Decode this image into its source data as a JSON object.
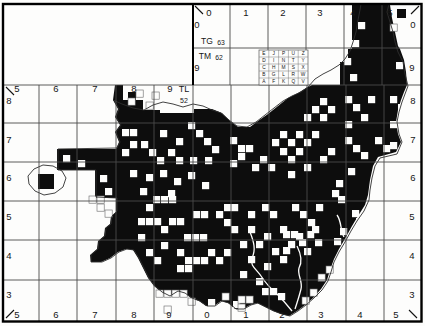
{
  "title": "Small White",
  "map": {
    "colors": {
      "ink": "#0d0d0d",
      "paper": "#fdfdfc",
      "grid": "#4a4a4a",
      "boundary": "#2e2e2e"
    },
    "tetrad_key": {
      "x": 259,
      "y": 50,
      "cell_w": 9.8,
      "cell_h": 7,
      "letters": [
        [
          "E",
          "J",
          "P",
          "U",
          "Z"
        ],
        [
          "D",
          "I",
          "N",
          "T",
          "Y"
        ],
        [
          "C",
          "H",
          "M",
          "S",
          "X"
        ],
        [
          "B",
          "G",
          "L",
          "R",
          "W"
        ],
        [
          "A",
          "F",
          "K",
          "Q",
          "V"
        ]
      ]
    },
    "grid": {
      "border": [
        3,
        4,
        418.5,
        317.5
      ],
      "main_v": [
        39,
        77,
        116,
        154,
        231,
        269,
        307,
        346,
        384
      ],
      "main_v_span": [
        85,
        321
      ],
      "main_h": [
        85,
        123,
        162,
        201,
        240,
        280
      ],
      "main_h_span": [
        3,
        421
      ],
      "divider_x": 193,
      "divider_top": 4,
      "divider_mid": 85,
      "divider_bottom": 321,
      "top_v": [
        230,
        268,
        306,
        344,
        382
      ],
      "top_v_span": [
        4,
        85
      ],
      "top_h": [
        48
      ],
      "top_h_span": [
        193,
        421
      ]
    },
    "corner_ticks": [
      [
        195,
        6,
        203,
        14
      ],
      [
        411,
        14,
        419,
        6
      ],
      [
        6,
        87,
        14,
        95
      ],
      [
        6,
        318,
        14,
        310
      ],
      [
        409,
        310,
        417,
        318
      ]
    ],
    "labels": [
      {
        "t": "0",
        "x": 209,
        "y": 16
      },
      {
        "t": "1",
        "x": 246,
        "y": 16
      },
      {
        "t": "2",
        "x": 283,
        "y": 16
      },
      {
        "t": "3",
        "x": 320,
        "y": 16
      },
      {
        "t": "4",
        "x": 353,
        "y": 16
      },
      {
        "t": "5",
        "x": 390,
        "y": 16
      },
      {
        "t": "0",
        "x": 197,
        "y": 28
      },
      {
        "t": "TG",
        "x": 207,
        "y": 44,
        "s": 8.5
      },
      {
        "t": "63",
        "x": 221,
        "y": 44.5,
        "s": 6.8
      },
      {
        "t": "TM",
        "x": 205,
        "y": 59,
        "s": 8.5
      },
      {
        "t": "62",
        "x": 219,
        "y": 59.5,
        "s": 6.8
      },
      {
        "t": "9",
        "x": 197,
        "y": 71
      },
      {
        "t": "0",
        "x": 413,
        "y": 28
      },
      {
        "t": "9",
        "x": 412,
        "y": 71
      },
      {
        "t": "5",
        "x": 17,
        "y": 92
      },
      {
        "t": "6",
        "x": 56,
        "y": 92
      },
      {
        "t": "7",
        "x": 95,
        "y": 92
      },
      {
        "t": "8",
        "x": 134,
        "y": 92
      },
      {
        "t": "9",
        "x": 170,
        "y": 92
      },
      {
        "t": "TL",
        "x": 184,
        "y": 92,
        "s": 9
      },
      {
        "t": "52",
        "x": 184,
        "y": 103,
        "s": 7
      },
      {
        "t": "8",
        "x": 9,
        "y": 104
      },
      {
        "t": "7",
        "x": 9,
        "y": 143
      },
      {
        "t": "6",
        "x": 9,
        "y": 181
      },
      {
        "t": "5",
        "x": 9,
        "y": 220
      },
      {
        "t": "4",
        "x": 9,
        "y": 259
      },
      {
        "t": "3",
        "x": 9,
        "y": 298
      },
      {
        "t": "8",
        "x": 413,
        "y": 104
      },
      {
        "t": "7",
        "x": 413,
        "y": 143
      },
      {
        "t": "6",
        "x": 413,
        "y": 181
      },
      {
        "t": "5",
        "x": 412,
        "y": 220
      },
      {
        "t": "4",
        "x": 412,
        "y": 259
      },
      {
        "t": "3",
        "x": 412,
        "y": 298
      },
      {
        "t": "5",
        "x": 17,
        "y": 318
      },
      {
        "t": "6",
        "x": 56,
        "y": 318
      },
      {
        "t": "7",
        "x": 95,
        "y": 318
      },
      {
        "t": "8",
        "x": 134,
        "y": 318
      },
      {
        "t": "9",
        "x": 169,
        "y": 318
      },
      {
        "t": "0",
        "x": 207,
        "y": 318
      },
      {
        "t": "1",
        "x": 246,
        "y": 318
      },
      {
        "t": "2",
        "x": 282,
        "y": 318
      },
      {
        "t": "3",
        "x": 321,
        "y": 318
      },
      {
        "t": "4",
        "x": 360,
        "y": 318
      },
      {
        "t": "5",
        "x": 396,
        "y": 318
      }
    ],
    "county_polygon": [
      [
        115,
        85
      ],
      [
        123,
        85
      ],
      [
        123,
        100
      ],
      [
        143,
        100
      ],
      [
        143,
        110
      ],
      [
        160,
        110
      ],
      [
        160,
        113
      ],
      [
        194,
        113
      ],
      [
        194,
        109
      ],
      [
        212,
        109
      ],
      [
        222,
        113
      ],
      [
        230,
        121
      ],
      [
        238,
        127
      ],
      [
        250,
        127
      ],
      [
        258,
        121
      ],
      [
        268,
        114
      ],
      [
        278,
        106
      ],
      [
        288,
        98
      ],
      [
        298,
        93
      ],
      [
        306,
        88
      ],
      [
        312,
        85
      ],
      [
        340,
        85
      ],
      [
        340,
        62
      ],
      [
        348,
        62
      ],
      [
        348,
        49
      ],
      [
        352,
        49
      ],
      [
        352,
        5
      ],
      [
        390,
        5
      ],
      [
        392,
        18
      ],
      [
        395,
        32
      ],
      [
        398,
        46
      ],
      [
        400,
        49
      ],
      [
        404,
        60
      ],
      [
        406,
        72
      ],
      [
        407,
        85
      ],
      [
        404,
        92
      ],
      [
        401,
        100
      ],
      [
        398,
        110
      ],
      [
        396,
        122
      ],
      [
        398,
        134
      ],
      [
        401,
        142
      ],
      [
        396,
        152
      ],
      [
        378,
        157
      ],
      [
        373,
        166
      ],
      [
        370,
        180
      ],
      [
        368,
        195
      ],
      [
        365,
        205
      ],
      [
        358,
        216
      ],
      [
        352,
        226
      ],
      [
        346,
        237
      ],
      [
        339,
        249
      ],
      [
        334,
        259
      ],
      [
        330,
        270
      ],
      [
        327,
        280
      ],
      [
        321,
        289
      ],
      [
        313,
        298
      ],
      [
        305,
        305
      ],
      [
        297,
        311
      ],
      [
        289,
        316
      ],
      [
        281,
        314
      ],
      [
        273,
        311
      ],
      [
        265,
        307
      ],
      [
        257,
        303
      ],
      [
        250,
        305
      ],
      [
        243,
        309
      ],
      [
        235,
        309
      ],
      [
        228,
        303
      ],
      [
        221,
        301
      ],
      [
        214,
        306
      ],
      [
        206,
        306
      ],
      [
        199,
        301
      ],
      [
        191,
        298
      ],
      [
        184,
        293
      ],
      [
        177,
        291
      ],
      [
        169,
        296
      ],
      [
        161,
        292
      ],
      [
        154,
        286
      ],
      [
        148,
        278
      ],
      [
        143,
        268
      ],
      [
        138,
        258
      ],
      [
        133,
        250
      ],
      [
        126,
        249
      ],
      [
        118,
        252
      ],
      [
        110,
        258
      ],
      [
        101,
        262
      ],
      [
        91,
        262
      ],
      [
        90,
        255
      ],
      [
        97,
        249
      ],
      [
        98,
        241
      ],
      [
        104,
        236
      ],
      [
        105,
        228
      ],
      [
        110,
        224
      ],
      [
        111,
        216
      ],
      [
        116,
        212
      ],
      [
        116,
        198
      ],
      [
        95,
        198
      ],
      [
        95,
        170
      ],
      [
        57,
        170
      ],
      [
        57,
        149
      ],
      [
        116,
        149
      ],
      [
        119,
        142
      ],
      [
        115,
        132
      ],
      [
        120,
        125
      ],
      [
        115,
        117
      ],
      [
        118,
        109
      ],
      [
        113,
        100
      ]
    ],
    "black_rects": [
      [
        38,
        174,
        16,
        15
      ],
      [
        397,
        9,
        9,
        9
      ],
      [
        128,
        92,
        8,
        8
      ]
    ],
    "hole_size": 7.2,
    "white_holes": [
      [
        122,
        129
      ],
      [
        130,
        129
      ],
      [
        130,
        141
      ],
      [
        122,
        149
      ],
      [
        141,
        141
      ],
      [
        149,
        149
      ],
      [
        157,
        157
      ],
      [
        168,
        149
      ],
      [
        176,
        157
      ],
      [
        188,
        122
      ],
      [
        196,
        130
      ],
      [
        204,
        138
      ],
      [
        212,
        146
      ],
      [
        160,
        130
      ],
      [
        176,
        138
      ],
      [
        190,
        157
      ],
      [
        205,
        157
      ],
      [
        130,
        170
      ],
      [
        146,
        174
      ],
      [
        160,
        170
      ],
      [
        174,
        178
      ],
      [
        188,
        172
      ],
      [
        202,
        182
      ],
      [
        140,
        188
      ],
      [
        168,
        190
      ],
      [
        63,
        155
      ],
      [
        78,
        160
      ],
      [
        100,
        175
      ],
      [
        105,
        188
      ],
      [
        230,
        137
      ],
      [
        238,
        145
      ],
      [
        246,
        145
      ],
      [
        238,
        153
      ],
      [
        230,
        160
      ],
      [
        272,
        139
      ],
      [
        280,
        131
      ],
      [
        288,
        139
      ],
      [
        296,
        131
      ],
      [
        280,
        148
      ],
      [
        288,
        156
      ],
      [
        296,
        148
      ],
      [
        304,
        139
      ],
      [
        312,
        131
      ],
      [
        312,
        106
      ],
      [
        320,
        114
      ],
      [
        328,
        106
      ],
      [
        304,
        114
      ],
      [
        320,
        98
      ],
      [
        260,
        156
      ],
      [
        268,
        164
      ],
      [
        252,
        164
      ],
      [
        288,
        171
      ],
      [
        304,
        164
      ],
      [
        320,
        156
      ],
      [
        328,
        148
      ],
      [
        345,
        96
      ],
      [
        353,
        104
      ],
      [
        368,
        96
      ],
      [
        390,
        96
      ],
      [
        398,
        104
      ],
      [
        345,
        121
      ],
      [
        361,
        114
      ],
      [
        390,
        121
      ],
      [
        345,
        137
      ],
      [
        353,
        145
      ],
      [
        375,
        137
      ],
      [
        383,
        145
      ],
      [
        361,
        152
      ],
      [
        390,
        142
      ],
      [
        348,
        168
      ],
      [
        336,
        180
      ],
      [
        332,
        190
      ],
      [
        338,
        196
      ],
      [
        352,
        210
      ],
      [
        356,
        218
      ],
      [
        340,
        228
      ],
      [
        334,
        238
      ],
      [
        153,
        196
      ],
      [
        161,
        196
      ],
      [
        169,
        196
      ],
      [
        146,
        204
      ],
      [
        138,
        218
      ],
      [
        146,
        218
      ],
      [
        154,
        218
      ],
      [
        169,
        218
      ],
      [
        177,
        218
      ],
      [
        138,
        234
      ],
      [
        161,
        226
      ],
      [
        184,
        234
      ],
      [
        192,
        234
      ],
      [
        200,
        234
      ],
      [
        193,
        211
      ],
      [
        201,
        211
      ],
      [
        216,
        211
      ],
      [
        224,
        204
      ],
      [
        231,
        204
      ],
      [
        224,
        219
      ],
      [
        231,
        226
      ],
      [
        177,
        249
      ],
      [
        185,
        257
      ],
      [
        193,
        257
      ],
      [
        201,
        257
      ],
      [
        177,
        265
      ],
      [
        185,
        265
      ],
      [
        146,
        249
      ],
      [
        154,
        257
      ],
      [
        208,
        249
      ],
      [
        216,
        257
      ],
      [
        224,
        249
      ],
      [
        161,
        242
      ],
      [
        248,
        211
      ],
      [
        262,
        204
      ],
      [
        270,
        211
      ],
      [
        292,
        204
      ],
      [
        300,
        211
      ],
      [
        308,
        219
      ],
      [
        316,
        204
      ],
      [
        248,
        226
      ],
      [
        264,
        233
      ],
      [
        280,
        226
      ],
      [
        296,
        233
      ],
      [
        312,
        226
      ],
      [
        256,
        241
      ],
      [
        272,
        248
      ],
      [
        288,
        241
      ],
      [
        304,
        248
      ],
      [
        240,
        241
      ],
      [
        248,
        256
      ],
      [
        264,
        263
      ],
      [
        280,
        256
      ],
      [
        240,
        271
      ],
      [
        256,
        278
      ],
      [
        283,
        231
      ],
      [
        291,
        231
      ],
      [
        299,
        239
      ],
      [
        283,
        247
      ],
      [
        307,
        231
      ],
      [
        315,
        239
      ],
      [
        262,
        288
      ],
      [
        270,
        288
      ],
      [
        278,
        293
      ],
      [
        156,
        299
      ],
      [
        164,
        299
      ],
      [
        233,
        301
      ],
      [
        208,
        299
      ],
      [
        358,
        22
      ],
      [
        352,
        40
      ],
      [
        344,
        58
      ],
      [
        350,
        74
      ],
      [
        396,
        62
      ]
    ],
    "outline_cells": [
      [
        128,
        98
      ],
      [
        136,
        90
      ],
      [
        146,
        102
      ],
      [
        152,
        92
      ],
      [
        89,
        196
      ],
      [
        97,
        196
      ],
      [
        97,
        204
      ],
      [
        105,
        210
      ],
      [
        156,
        290
      ],
      [
        164,
        290
      ],
      [
        172,
        290
      ],
      [
        180,
        290
      ],
      [
        164,
        306
      ],
      [
        188,
        298
      ],
      [
        318,
        274
      ],
      [
        326,
        266
      ],
      [
        310,
        289
      ],
      [
        302,
        297
      ],
      [
        238,
        296
      ],
      [
        246,
        296
      ],
      [
        238,
        304
      ],
      [
        222,
        293
      ],
      [
        390,
        24
      ]
    ],
    "boundary_paths": [
      "M113,100 L122,104 L133,108 L144,110 L153,105 L163,102 L173,104 L183,107 L193,104 L203,106 L212,110 L221,113 L229,120 L237,126 L247,127 L256,122 L265,115 L274,108 L283,101 L292,96 L301,92 L308,87 L315,79 L323,74 L331,70 L339,65 L345,59 L350,51 L353,42 L356,32 L358,20 L360,10 L361,4",
      "M389,4 L387,12 L390,22 L393,32 L395,42 L398,52 L403,62 L405,74 L408,86 L405,94 L402,102 L399,112 L397,122 L399,134 L402,142 L397,154 L380,158 L375,166 L372,178 L370,190 L369,200 L364,211 L357,221 L351,231 L345,242 L339,252 L334,262 L331,272 L328,281 L322,290 L314,298 L306,305 L298,311 L290,316",
      "M290,316 L282,314 L274,311 L266,307 L258,303 L251,305 L244,309 L236,309 L229,303 L222,301 L215,306 L207,306 L200,301 L192,298 L185,293 L178,291 L170,296 L162,292 L155,286 L149,278 L144,268 L139,258 L134,250 L127,249 L119,252 L111,258 L102,262 L91,262 L91,255 L98,249 L99,241 L105,236 L106,228 L111,224 L112,216 L117,211 L117,198 L96,197 L96,170 L58,170 L58,149 L117,148 L120,142 L116,132 L121,125 L116,117 L119,109 L114,100",
      "M29,184 L28,176 L34,169 L43,165 L53,166 L62,171 L66,178 L63,187 L55,193 L44,195 L35,191 L29,184 Z"
    ],
    "rivers": [
      "M250,232 C254,242 256,250 252,258 C249,265 257,270 261,276 C265,282 271,289 277,294 C282,299 288,306 292,311",
      "M297,246 C301,254 303,261 299,268 C297,275 303,281 301,289 C299,297 297,303 295,309",
      "M337,215 C342,222 340,230 344,237"
    ]
  }
}
